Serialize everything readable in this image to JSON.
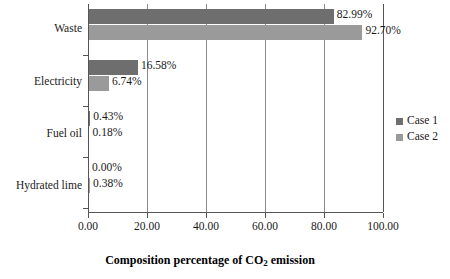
{
  "chart_data": {
    "type": "bar",
    "orientation": "horizontal",
    "title": "",
    "xlabel": "Composition percentage of CO2 emission",
    "xlabel_html": "Composition percentage of CO<sub>2</sub> emission",
    "ylabel": "",
    "categories": [
      "Waste",
      "Electricity",
      "Fuel oil",
      "Hydrated lime"
    ],
    "series": [
      {
        "name": "Case 1",
        "color": "#6e6e6e",
        "values": [
          82.99,
          16.58,
          0.43,
          0.0
        ],
        "labels": [
          "82.99%",
          "16.58%",
          "0.43%",
          "0.00%"
        ]
      },
      {
        "name": "Case 2",
        "color": "#9a9a9a",
        "values": [
          92.7,
          6.74,
          0.18,
          0.38
        ],
        "labels": [
          "92.70%",
          "6.74%",
          "0.18%",
          "0.38%"
        ]
      }
    ],
    "xlim": [
      0,
      100
    ],
    "xticks": [
      0,
      20,
      40,
      60,
      80,
      100
    ],
    "xtick_labels": [
      "0.00",
      "20.00",
      "40.00",
      "60.00",
      "80.00",
      "100.00"
    ],
    "grid": "vertical",
    "legend_position": "right"
  },
  "legend": {
    "items": [
      {
        "label": "Case 1",
        "color": "#6e6e6e"
      },
      {
        "label": "Case 2",
        "color": "#9a9a9a"
      }
    ]
  }
}
